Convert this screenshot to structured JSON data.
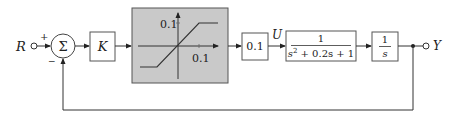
{
  "diagram": {
    "type": "block-diagram",
    "input": {
      "label": "R"
    },
    "output": {
      "label": "Y"
    },
    "summing_junction": {
      "symbol": "Σ",
      "plus_sign": "+",
      "minus_sign": "−"
    },
    "blocks": [
      {
        "id": "gain-k",
        "label": "K"
      },
      {
        "id": "saturation",
        "type": "saturation-nonlinearity",
        "y_tick_label": "0.1",
        "x_tick_label": "0.1",
        "background": "#c8c8c8"
      },
      {
        "id": "gain-01",
        "label": "0.1"
      },
      {
        "id": "plant",
        "numerator": "1",
        "denominator_s": "s",
        "denominator_exp": "2",
        "denominator_rest": " + 0.2s + 1"
      },
      {
        "id": "integrator",
        "numerator": "1",
        "denominator": "s"
      }
    ],
    "signals": {
      "u_label": "U"
    },
    "feedback": "unity negative feedback from Y to summing junction"
  }
}
